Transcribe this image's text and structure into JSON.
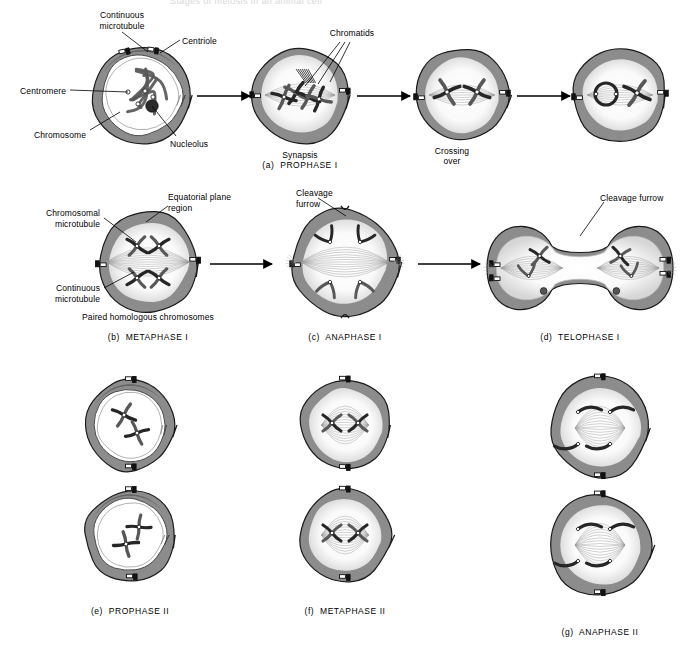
{
  "figure": {
    "title": "Stages of meiosis in an animal cell",
    "subject": "meiosis"
  },
  "palette": {
    "cytoplasm": "#8c8c8c",
    "cytoplasm_dark": "#6e6e6e",
    "membrane_outline": "#1a1a1a",
    "nucleoplasm": "#ffffff",
    "chromosome_dark": "#262626",
    "chromosome_mid": "#585858",
    "spindle": "#9a9a9a",
    "paper": "#ffffff",
    "ink": "#000000"
  },
  "rows": [
    {
      "id": "row-1",
      "caption": "(a)  PROPHASE I",
      "caption_x": 300,
      "caption_y": 160,
      "cells": [
        {
          "id": "prophase-1-early",
          "cx": 142,
          "cy": 95,
          "r": 52,
          "kind": "nucleus-intact",
          "sublabel": null
        },
        {
          "id": "prophase-1-synapsis",
          "cx": 300,
          "cy": 95,
          "r": 50,
          "kind": "synapsis",
          "sublabel": "Synapsis",
          "sublabel_x": 300,
          "sublabel_y": 150
        },
        {
          "id": "prophase-1-crossing-over",
          "cx": 462,
          "cy": 95,
          "r": 48,
          "kind": "crossing-over",
          "sublabel": "Crossing\nover",
          "sublabel_x": 452,
          "sublabel_y": 146
        },
        {
          "id": "prophase-1-late",
          "cx": 620,
          "cy": 95,
          "r": 48,
          "kind": "late-prophase",
          "sublabel": null
        }
      ],
      "arrows": [
        {
          "x1": 197,
          "y1": 96,
          "x2": 250,
          "y2": 96
        },
        {
          "x1": 357,
          "y1": 96,
          "x2": 410,
          "y2": 96
        },
        {
          "x1": 517,
          "y1": 96,
          "x2": 570,
          "y2": 96
        }
      ],
      "labels": [
        {
          "text": "Continuous\nmicrotubule",
          "x": 122,
          "y": 10,
          "align": "c",
          "leader": "M 122,32 L 148,52"
        },
        {
          "text": "Centriole",
          "x": 182,
          "y": 36,
          "align": "l",
          "leader": "M 180,40 L 160,53"
        },
        {
          "text": "Centromere",
          "x": 66,
          "y": 86,
          "align": "r",
          "leader": "M 70,90 L 128,92"
        },
        {
          "text": "Chromosome",
          "x": 86,
          "y": 130,
          "align": "r",
          "leader": "M 90,130 L 120,112"
        },
        {
          "text": "Nucleolus",
          "x": 170,
          "y": 139,
          "align": "l",
          "leader": "M 176,136 L 152,106"
        },
        {
          "text": "Chromatids",
          "x": 352,
          "y": 28,
          "align": "c",
          "leader": "M 340,42 L 305,86 M 345,42 L 318,84 M 350,42 L 330,82"
        }
      ]
    },
    {
      "id": "row-2",
      "caption": null,
      "cells": [
        {
          "id": "metaphase-1",
          "cx": 148,
          "cy": 262,
          "r": 52,
          "kind": "metaphase-1",
          "sublabel": "Paired homologous chromosomes",
          "sublabel_x": 148,
          "sublabel_y": 312
        },
        {
          "id": "anaphase-1",
          "cx": 345,
          "cy": 262,
          "r": 55,
          "kind": "anaphase-1",
          "sublabel": null
        },
        {
          "id": "telophase-1",
          "cx": 580,
          "cy": 268,
          "r": 60,
          "kind": "telophase-1",
          "sublabel": null
        }
      ],
      "arrows": [
        {
          "x1": 210,
          "y1": 264,
          "x2": 272,
          "y2": 264
        },
        {
          "x1": 418,
          "y1": 264,
          "x2": 480,
          "y2": 264
        }
      ],
      "labels": [
        {
          "text": "Equatorial plane\nregion",
          "x": 168,
          "y": 192,
          "align": "l",
          "leader": "M 168,206 L 146,222"
        },
        {
          "text": "Chromosomal\nmicrotubule",
          "x": 100,
          "y": 208,
          "align": "r",
          "leader": "M 104,218 L 136,242"
        },
        {
          "text": "Continuous\nmicrotubule",
          "x": 100,
          "y": 283,
          "align": "r",
          "leader": "M 104,288 L 134,272"
        },
        {
          "text": "Cleavage\nfurrow",
          "x": 296,
          "y": 188,
          "align": "l",
          "leader": "M 318,198 L 346,216"
        },
        {
          "text": "Cleavage furrow",
          "x": 600,
          "y": 193,
          "align": "l",
          "leader": "M 604,202 L 580,236"
        }
      ],
      "captions": [
        {
          "text": "(b)  METAPHASE I",
          "x": 148,
          "y": 332
        },
        {
          "text": "(c)  ANAPHASE I",
          "x": 345,
          "y": 332
        },
        {
          "text": "(d)  TELOPHASE I",
          "x": 580,
          "y": 332
        }
      ]
    },
    {
      "id": "row-3",
      "caption": null,
      "cells": [
        {
          "id": "prophase-2-top",
          "cx": 130,
          "cy": 425,
          "r": 47,
          "kind": "prophase-2-a",
          "sublabel": null
        },
        {
          "id": "prophase-2-bottom",
          "cx": 130,
          "cy": 535,
          "r": 47,
          "kind": "prophase-2-b",
          "sublabel": null
        },
        {
          "id": "metaphase-2-top",
          "cx": 345,
          "cy": 425,
          "r": 47,
          "kind": "metaphase-2",
          "sublabel": null
        },
        {
          "id": "metaphase-2-bottom",
          "cx": 345,
          "cy": 535,
          "r": 47,
          "kind": "metaphase-2",
          "sublabel": null
        },
        {
          "id": "anaphase-2-top",
          "cx": 600,
          "cy": 428,
          "r": 52,
          "kind": "anaphase-2",
          "sublabel": null
        },
        {
          "id": "anaphase-2-bottom",
          "cx": 600,
          "cy": 545,
          "r": 52,
          "kind": "anaphase-2",
          "sublabel": null
        }
      ],
      "arrows": [],
      "labels": [],
      "captions": [
        {
          "text": "(e)  PROPHASE II",
          "x": 130,
          "y": 606
        },
        {
          "text": "(f)  METAPHASE II",
          "x": 345,
          "y": 606
        },
        {
          "text": "(g)  ANAPHASE II",
          "x": 600,
          "y": 627
        }
      ]
    }
  ]
}
